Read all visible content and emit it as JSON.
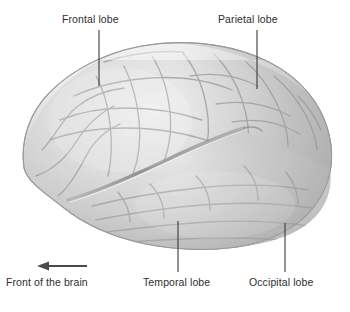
{
  "figure": {
    "background_color": "#ffffff"
  },
  "labels": {
    "frontal": "Frontal lobe",
    "parietal": "Parietal lobe",
    "temporal": "Temporal lobe",
    "occipital": "Occipital lobe",
    "orientation": "Front of the brain"
  },
  "colors": {
    "text": "#2e2e2e",
    "leader_line": "#3a3a3a",
    "arrow": "#4a4a4a",
    "brain_base": "#cfcfcf",
    "brain_light": "#ededed",
    "brain_mid": "#c4c4c4",
    "brain_dark": "#a9a9a9",
    "sulcus": "#9a9a9a",
    "outline": "#9d9d9d"
  },
  "leader_lines": [
    {
      "name": "frontal",
      "x": 99,
      "y1": 30,
      "y2": 86
    },
    {
      "name": "parietal",
      "x": 257,
      "y1": 30,
      "y2": 89
    },
    {
      "name": "temporal",
      "x": 178,
      "y1": 221,
      "y2": 272
    },
    {
      "name": "occipital",
      "x": 285,
      "y1": 223,
      "y2": 272
    }
  ],
  "orientation_arrow": {
    "direction": "left",
    "x_tail": 87,
    "x_head": 37,
    "y": 266
  }
}
